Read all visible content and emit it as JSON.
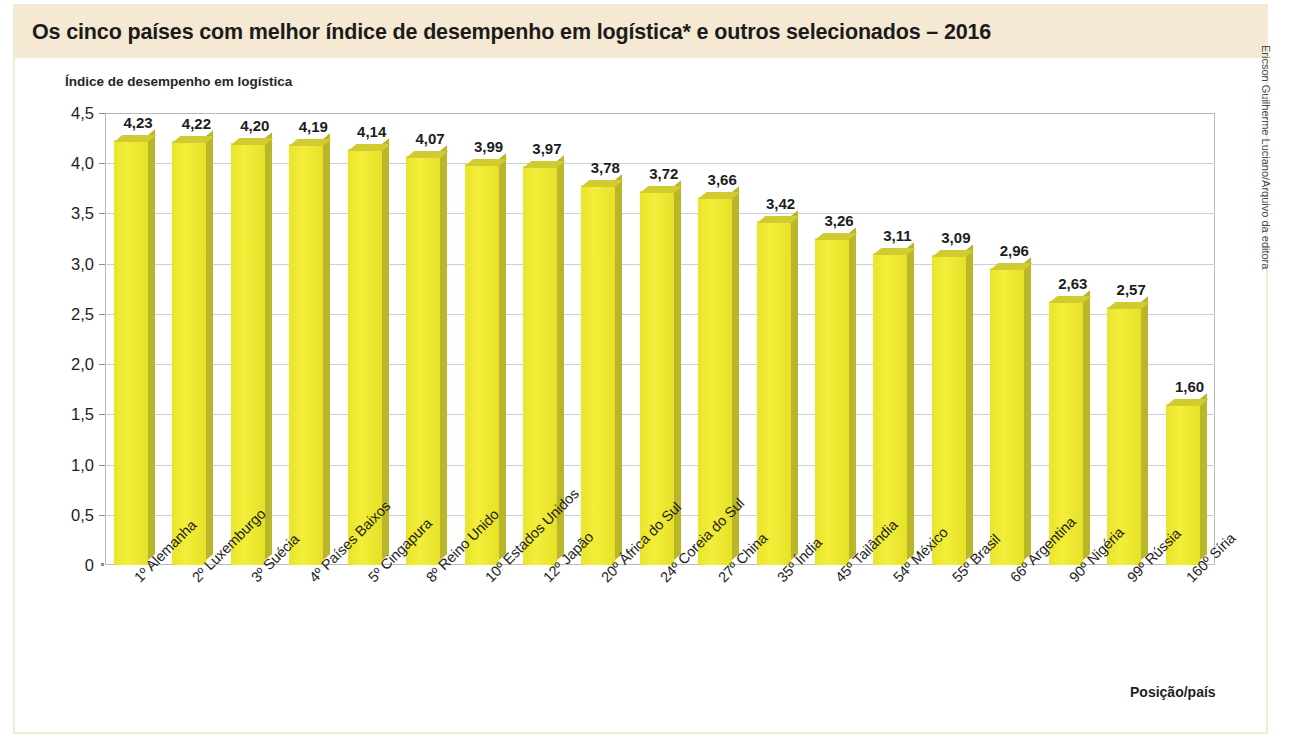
{
  "figure": {
    "title": "Os cinco países com melhor índice de desempenho em logística* e outros selecionados – 2016",
    "credit": "Ericson Guilherme Luciano/Arquivo da editora",
    "band_color": "#f5e9d3",
    "bar_color": "#ecea2c",
    "bar_side_color": "#b9b62a"
  },
  "chart_data": {
    "type": "bar",
    "title": "Os cinco países com melhor índice de desempenho em logística* e outros selecionados – 2016",
    "ylabel": "Índice de desempenho em logística",
    "xlabel": "Posição/país",
    "ylim": [
      0,
      4.5
    ],
    "yticks": [
      "0",
      "0,5",
      "1,0",
      "1,5",
      "2,0",
      "2,5",
      "3,0",
      "3,5",
      "4,0",
      "4,5"
    ],
    "ytick_values": [
      0,
      0.5,
      1.0,
      1.5,
      2.0,
      2.5,
      3.0,
      3.5,
      4.0,
      4.5
    ],
    "grid": true,
    "legend": "none",
    "categories": [
      "1º Alemanha",
      "2º Luxemburgo",
      "3º Suécia",
      "4º Países Baixos",
      "5º Cingapura",
      "8º Reino Unido",
      "10º Estados Unidos",
      "12º Japão",
      "20º África do Sul",
      "24º Coreia do Sul",
      "27º China",
      "35º Índia",
      "45º Tailândia",
      "54º México",
      "55º Brasil",
      "66º Argentina",
      "90º Nigéria",
      "99º Rússia",
      "160º Síria"
    ],
    "values": [
      4.23,
      4.22,
      4.2,
      4.19,
      4.14,
      4.07,
      3.99,
      3.97,
      3.78,
      3.72,
      3.66,
      3.42,
      3.26,
      3.11,
      3.09,
      2.96,
      2.63,
      2.57,
      1.6
    ],
    "value_labels": [
      "4,23",
      "4,22",
      "4,20",
      "4,19",
      "4,14",
      "4,07",
      "3,99",
      "3,97",
      "3,78",
      "3,72",
      "3,66",
      "3,42",
      "3,26",
      "3,11",
      "3,09",
      "2,96",
      "2,63",
      "2,57",
      "1,60"
    ]
  }
}
